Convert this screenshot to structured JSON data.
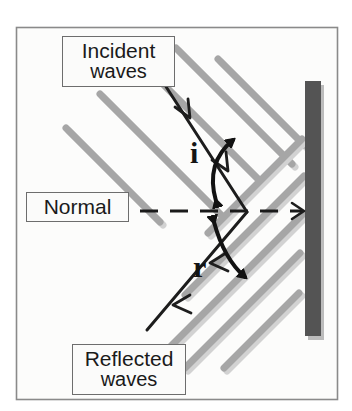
{
  "figure": {
    "background_color": "#ffffff",
    "frame": {
      "name": "outer-frame",
      "x": 16,
      "y": 27,
      "width": 322,
      "height": 373,
      "border_color": "#8a8a8a",
      "fill_color": "#fcfcfb"
    }
  },
  "labels": {
    "incident": {
      "line1": "Incident",
      "line2": "waves"
    },
    "normal": {
      "line1": "Normal"
    },
    "reflected": {
      "line1": "Reflected",
      "line2": "waves"
    }
  },
  "angles": {
    "incidence": {
      "symbol": "i",
      "meaning": "angle of incidence"
    },
    "reflection": {
      "symbol": "r",
      "meaning": "angle of reflection"
    }
  },
  "mirror": {
    "name": "mirror-bar",
    "x": 305,
    "y": 81,
    "width": 16,
    "height": 255,
    "color": "#545454",
    "shadow_color": "#b9b9b9"
  },
  "normal_line": {
    "name": "normal-dashed-line",
    "x_start": 140,
    "x_end": 308,
    "y": 211,
    "color": "#1a1a1a",
    "style": "dashed",
    "dash_pattern": "18 12",
    "width": 3
  },
  "wavefronts": {
    "color": "#a6a6a6",
    "shadow_color": "#cfcfcf",
    "stroke_width": 7,
    "incident": {
      "direction": "down-right",
      "count": 5,
      "segments": [
        {
          "x1": 66,
          "y1": 128,
          "x2": 160,
          "y2": 222
        },
        {
          "x1": 100,
          "y1": 94,
          "x2": 222,
          "y2": 216
        },
        {
          "x1": 137,
          "y1": 58,
          "x2": 258,
          "y2": 179
        },
        {
          "x1": 176,
          "y1": 48,
          "x2": 292,
          "y2": 164
        },
        {
          "x1": 218,
          "y1": 59,
          "x2": 304,
          "y2": 145
        }
      ]
    },
    "reflected": {
      "direction": "down-left",
      "count": 5,
      "segments": [
        {
          "x1": 302,
          "y1": 139,
          "x2": 208,
          "y2": 233
        },
        {
          "x1": 304,
          "y1": 176,
          "x2": 185,
          "y2": 295
        },
        {
          "x1": 303,
          "y1": 214,
          "x2": 166,
          "y2": 351
        },
        {
          "x1": 300,
          "y1": 253,
          "x2": 185,
          "y2": 368
        },
        {
          "x1": 299,
          "y1": 293,
          "x2": 224,
          "y2": 368
        }
      ]
    }
  },
  "rays": {
    "color": "#1d1d1d",
    "stroke_width": 3,
    "incident_ray": {
      "name": "incident-ray",
      "x1": 152,
      "y1": 65,
      "x2": 247,
      "y2": 212,
      "arrow_direction": "toward mirror (down-right)",
      "arrowhead_count": 2
    },
    "reflected_ray": {
      "name": "reflected-ray",
      "x1": 247,
      "y1": 212,
      "x2": 147,
      "y2": 330,
      "arrow_direction": "away from mirror (down-left)",
      "arrowhead_count": 2
    },
    "normal_arrow": {
      "name": "normal-arrowhead",
      "x": 305,
      "y": 211,
      "arrow_direction": "toward mirror (right)"
    }
  },
  "angle_arcs": {
    "color": "#121212",
    "stroke_width": 4,
    "incidence_arc": {
      "name": "angle-i-arc",
      "from": "incident ray",
      "to": "normal",
      "double_headed": true
    },
    "reflection_arc": {
      "name": "angle-r-arc",
      "from": "normal",
      "to": "reflected ray",
      "double_headed": true
    }
  }
}
